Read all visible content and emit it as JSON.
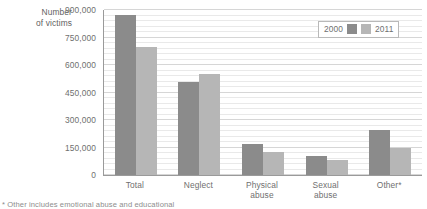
{
  "chart_data": {
    "type": "bar",
    "title": "",
    "xlabel": "",
    "ylabel": "Number of victims",
    "categories": [
      "Total",
      "Neglect",
      "Physical abuse",
      "Sexual abuse",
      "Other*"
    ],
    "series": [
      {
        "name": "2000",
        "color": "#8b8b8b",
        "values": [
          875000,
          510000,
          170000,
          105000,
          245000
        ]
      },
      {
        "name": "2011",
        "color": "#b6b6b6",
        "values": [
          700000,
          550000,
          125000,
          80000,
          148000
        ]
      }
    ],
    "ylim": [
      0,
      900000
    ],
    "y_ticks": [
      0,
      150000,
      300000,
      450000,
      600000,
      750000,
      900000
    ],
    "y_tick_labels": [
      "0",
      "150,000",
      "300,000",
      "450,000",
      "600,000",
      "750,000",
      "900,000"
    ],
    "minor_gridline_step": 30000,
    "grid": true,
    "legend_position": "top-right",
    "legend_entries": [
      "2000",
      "2011"
    ]
  },
  "axis": {
    "y_title_line1": "Number",
    "y_title_line2": "of victims"
  },
  "footnote": "* Other includes emotional abuse and educational"
}
